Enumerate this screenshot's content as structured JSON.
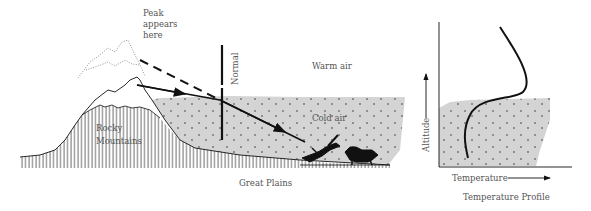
{
  "diagram": {
    "labels": {
      "peak_appears_line1": "Peak",
      "peak_appears_line2": "appears",
      "peak_appears_line3": "here",
      "normal": "Normal",
      "warm_air": "Warm air",
      "cold_air": "Cold air",
      "rocky_line1": "Rocky",
      "rocky_line2": "Mountains",
      "great_plains": "Great Plains"
    },
    "profile": {
      "y_axis_label": "Altitude",
      "x_axis_label": "Temperature",
      "caption": "Temperature Profile"
    },
    "colors": {
      "cold_air_fill": "#d4d4d4",
      "ink": "#111111",
      "text": "#555555"
    }
  }
}
